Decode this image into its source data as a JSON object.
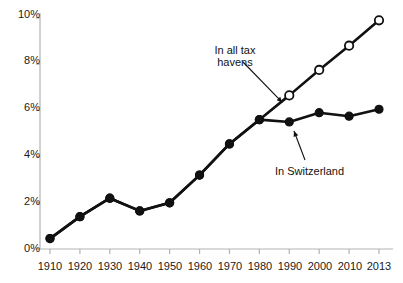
{
  "chart_data": {
    "type": "line",
    "title": "",
    "subtitle": "",
    "xlabel": "",
    "ylabel": "",
    "x": [
      1910,
      1920,
      1930,
      1940,
      1950,
      1960,
      1970,
      1980,
      1990,
      2000,
      2010,
      2013
    ],
    "categories": [
      "1910",
      "1920",
      "1930",
      "1940",
      "1950",
      "1960",
      "1970",
      "1980",
      "1990",
      "2000",
      "2010",
      "2013"
    ],
    "xtick_labels": [
      "1910",
      "1920",
      "1930",
      "1940",
      "1950",
      "1960",
      "1970",
      "1980",
      "1990",
      "2000",
      "2010",
      "2013"
    ],
    "ytick_labels": [
      "0%",
      "2%",
      "4%",
      "6%",
      "8%",
      "10%"
    ],
    "ytick_values": [
      0,
      2,
      4,
      6,
      8,
      10
    ],
    "ylim": [
      0,
      10
    ],
    "xlim": [
      1910,
      2013
    ],
    "grid": false,
    "legend_position": "inline-annotations",
    "series": [
      {
        "name": "In all tax havens",
        "marker": "open-circle",
        "color": "#111111",
        "values": [
          0.45,
          1.4,
          2.2,
          1.65,
          2.0,
          3.2,
          4.55,
          5.6,
          6.65,
          7.75,
          8.8,
          9.9
        ]
      },
      {
        "name": "In Switzerland",
        "marker": "filled-circle",
        "color": "#111111",
        "values": [
          0.45,
          1.4,
          2.2,
          1.65,
          2.0,
          3.2,
          4.55,
          5.6,
          5.5,
          5.9,
          5.75,
          6.05
        ]
      }
    ],
    "annotations": [
      {
        "id": "tax-havens",
        "text_lines": [
          "In all tax",
          "havens"
        ],
        "points_to_x": 1990,
        "points_to_y": 6.65
      },
      {
        "id": "switzerland",
        "text_lines": [
          "In Switzerland"
        ],
        "points_to_x": 2002,
        "points_to_y": 5.6
      }
    ],
    "colors": {
      "line": "#111111",
      "marker_fill_open": "#ffffff",
      "marker_fill_closed": "#111111",
      "axis": "#b3b3b3",
      "text": "#1a1a1a",
      "background": "#ffffff"
    }
  },
  "axes": {
    "y_ticks": [
      {
        "label": "10%"
      },
      {
        "label": "8%"
      },
      {
        "label": "6%"
      },
      {
        "label": "4%"
      },
      {
        "label": "2%"
      },
      {
        "label": "0%"
      }
    ],
    "x_ticks": [
      {
        "label": "1910"
      },
      {
        "label": "1920"
      },
      {
        "label": "1930"
      },
      {
        "label": "1940"
      },
      {
        "label": "1950"
      },
      {
        "label": "1960"
      },
      {
        "label": "1970"
      },
      {
        "label": "1980"
      },
      {
        "label": "1990"
      },
      {
        "label": "2000"
      },
      {
        "label": "2010"
      },
      {
        "label": "2013"
      }
    ]
  },
  "annotations": {
    "tax_havens_line1": "In all tax",
    "tax_havens_line2": "havens",
    "switzerland": "In Switzerland"
  }
}
